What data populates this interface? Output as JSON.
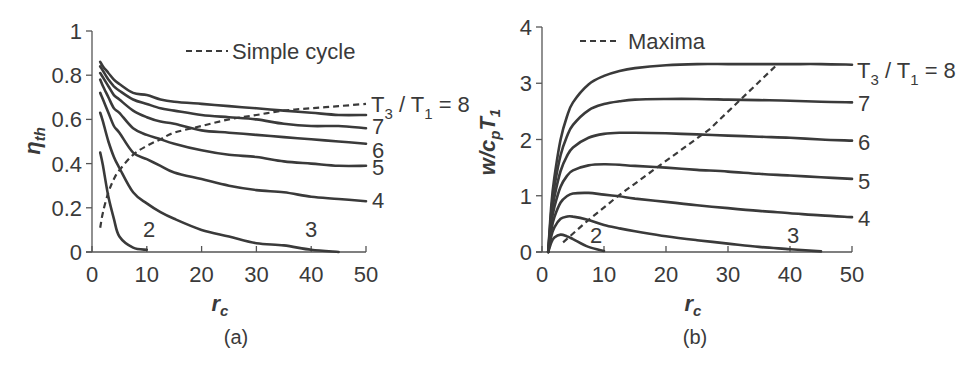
{
  "chart_data": [
    {
      "panel": "a",
      "type": "line",
      "caption": "(a)",
      "title": "",
      "xlabel": "r_c",
      "ylabel": "η_th",
      "xlim": [
        0,
        50
      ],
      "ylim": [
        0,
        1
      ],
      "xticks": [
        0,
        10,
        20,
        30,
        40,
        50
      ],
      "yticks": [
        0,
        0.2,
        0.4,
        0.6,
        0.8,
        1
      ],
      "ytick_labels": [
        "0",
        "0.2",
        "0.4",
        "0.6",
        "0.8",
        "1"
      ],
      "grid": false,
      "legend": {
        "entries": [
          {
            "label": "Simple cycle",
            "style": "dashed"
          }
        ],
        "position": "top"
      },
      "family_label": "T3 / T1 = 8",
      "x": [
        1.5,
        2,
        3,
        4,
        5,
        7.5,
        10,
        12.5,
        15,
        20,
        25,
        30,
        35,
        40,
        45,
        50
      ],
      "series": [
        {
          "name": "T3/T1 = 8",
          "label": "T3 / T1 = 8",
          "values": [
            0.86,
            0.84,
            0.81,
            0.78,
            0.76,
            0.72,
            0.71,
            0.69,
            0.68,
            0.67,
            0.66,
            0.65,
            0.64,
            0.63,
            0.62,
            0.62
          ]
        },
        {
          "name": "T3/T1 = 7",
          "label": "7",
          "values": [
            0.84,
            0.82,
            0.78,
            0.75,
            0.73,
            0.69,
            0.67,
            0.65,
            0.64,
            0.62,
            0.61,
            0.6,
            0.58,
            0.57,
            0.57,
            0.56
          ]
        },
        {
          "name": "T3/T1 = 6",
          "label": "6",
          "values": [
            0.81,
            0.79,
            0.75,
            0.71,
            0.69,
            0.64,
            0.61,
            0.59,
            0.58,
            0.55,
            0.54,
            0.53,
            0.52,
            0.51,
            0.5,
            0.49
          ]
        },
        {
          "name": "T3/T1 = 5",
          "label": "5",
          "values": [
            0.78,
            0.75,
            0.7,
            0.65,
            0.63,
            0.56,
            0.53,
            0.51,
            0.49,
            0.46,
            0.44,
            0.43,
            0.41,
            0.4,
            0.39,
            0.39
          ]
        },
        {
          "name": "T3/T1 = 4",
          "label": "4",
          "values": [
            0.72,
            0.69,
            0.63,
            0.57,
            0.54,
            0.45,
            0.42,
            0.39,
            0.36,
            0.33,
            0.3,
            0.28,
            0.27,
            0.25,
            0.24,
            0.23
          ]
        },
        {
          "name": "T3/T1 = 3",
          "label": "3",
          "values": [
            0.63,
            0.59,
            0.5,
            0.43,
            0.38,
            0.27,
            0.22,
            0.18,
            0.15,
            0.1,
            0.07,
            0.04,
            0.03,
            0.01,
            0.0,
            null
          ]
        },
        {
          "name": "T3/T1 = 2",
          "label": "2",
          "values": [
            0.45,
            0.39,
            0.25,
            0.15,
            0.07,
            0.02,
            0.01,
            null,
            null,
            null,
            null,
            null,
            null,
            null,
            null,
            null
          ]
        },
        {
          "name": "Simple cycle",
          "label": "Simple cycle",
          "style": "dashed",
          "values": [
            0.11,
            0.18,
            0.27,
            0.33,
            0.37,
            0.44,
            0.48,
            0.51,
            0.54,
            0.57,
            0.6,
            0.62,
            0.64,
            0.65,
            0.66,
            0.67
          ]
        }
      ]
    },
    {
      "panel": "b",
      "type": "line",
      "caption": "(b)",
      "title": "",
      "xlabel": "r_c",
      "ylabel": "w/c_p T_1",
      "xlim": [
        0,
        50
      ],
      "ylim": [
        0,
        4
      ],
      "xticks": [
        0,
        10,
        20,
        30,
        40,
        50
      ],
      "yticks": [
        0,
        1,
        2,
        3,
        4
      ],
      "ytick_labels": [
        "0",
        "1",
        "2",
        "3",
        "4"
      ],
      "grid": false,
      "legend": {
        "entries": [
          {
            "label": "Maxima",
            "style": "dashed"
          }
        ],
        "position": "top-left"
      },
      "family_label": "T3 / T1 = 8",
      "x": [
        1,
        1.5,
        2,
        3,
        4,
        5,
        7.5,
        10,
        12.5,
        15,
        20,
        25,
        30,
        35,
        40,
        45,
        50
      ],
      "series": [
        {
          "name": "T3/T1 = 8",
          "label": "T3 / T1 = 8",
          "values": [
            0,
            0.83,
            1.33,
            2.0,
            2.4,
            2.66,
            2.98,
            3.13,
            3.22,
            3.27,
            3.32,
            3.34,
            3.34,
            3.34,
            3.34,
            3.34,
            3.33
          ]
        },
        {
          "name": "T3/T1 = 7",
          "label": "7",
          "values": [
            0,
            0.72,
            1.16,
            1.72,
            2.05,
            2.26,
            2.52,
            2.63,
            2.68,
            2.71,
            2.72,
            2.72,
            2.71,
            2.7,
            2.69,
            2.67,
            2.66
          ]
        },
        {
          "name": "T3/T1 = 6",
          "label": "6",
          "values": [
            0,
            0.61,
            0.98,
            1.44,
            1.7,
            1.86,
            2.03,
            2.1,
            2.12,
            2.12,
            2.11,
            2.09,
            2.07,
            2.05,
            2.03,
            2.0,
            1.98
          ]
        },
        {
          "name": "T3/T1 = 5",
          "label": "5",
          "values": [
            0,
            0.5,
            0.8,
            1.16,
            1.35,
            1.45,
            1.54,
            1.56,
            1.55,
            1.53,
            1.5,
            1.46,
            1.43,
            1.39,
            1.36,
            1.33,
            1.3
          ]
        },
        {
          "name": "T3/T1 = 4",
          "label": "4",
          "values": [
            0,
            0.39,
            0.62,
            0.88,
            0.99,
            1.04,
            1.05,
            1.02,
            0.99,
            0.95,
            0.89,
            0.83,
            0.78,
            0.73,
            0.69,
            0.65,
            0.62
          ]
        },
        {
          "name": "T3/T1 = 3",
          "label": "3",
          "values": [
            0,
            0.28,
            0.44,
            0.59,
            0.63,
            0.63,
            0.57,
            0.48,
            0.42,
            0.37,
            0.28,
            0.21,
            0.15,
            0.09,
            0.05,
            0.01,
            null
          ]
        },
        {
          "name": "T3/T1 = 2",
          "label": "2",
          "values": [
            0,
            0.17,
            0.26,
            0.31,
            0.28,
            0.23,
            0.09,
            0.02,
            null,
            null,
            null,
            null,
            null,
            null,
            null,
            null,
            null
          ]
        },
        {
          "name": "Maxima",
          "label": "Maxima",
          "style": "dashed",
          "x": [
            3.4,
            7.2,
            12.3,
            19.0,
            27.0,
            38.0
          ],
          "values": [
            0.17,
            0.54,
            1.0,
            1.54,
            2.18,
            3.34
          ]
        }
      ]
    }
  ],
  "panel_a": {
    "legend_label": "Simple cycle",
    "y_title": "η",
    "y_title_sub": "th",
    "x_title": "r",
    "x_title_sub": "c",
    "caption": "(a)",
    "family_label_main": "T",
    "family_label_sub1": "3",
    "family_label_mid": " / T",
    "family_label_sub2": "1",
    "family_label_end": " = 8",
    "curve_labels": {
      "7": "7",
      "6": "6",
      "5": "5",
      "4": "4",
      "3": "3",
      "2": "2"
    }
  },
  "panel_b": {
    "legend_label": "Maxima",
    "y_title_w": "w/c",
    "y_title_sub_p": "p",
    "y_title_T": "T",
    "y_title_sub_1": "1",
    "x_title": "r",
    "x_title_sub": "c",
    "caption": "(b)",
    "family_label_main": "T",
    "family_label_sub1": "3",
    "family_label_mid": " / T",
    "family_label_sub2": "1",
    "family_label_end": " = 8",
    "curve_labels": {
      "7": "7",
      "6": "6",
      "5": "5",
      "4": "4",
      "3": "3",
      "2": "2"
    }
  }
}
